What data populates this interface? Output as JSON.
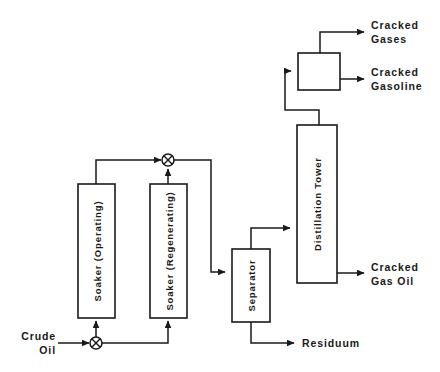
{
  "diagram": {
    "type": "process-flow-diagram",
    "colors": {
      "line": "#1a1a1a",
      "background": "#ffffff",
      "box_fill": "#ffffff"
    },
    "units": [
      {
        "id": "soaker-operating",
        "label": "Soaker (Operating)",
        "orientation": "vertical-text",
        "x": 78,
        "y": 184,
        "w": 37,
        "h": 134
      },
      {
        "id": "soaker-regenerating",
        "label": "Soaker (Regenerating)",
        "orientation": "vertical-text",
        "x": 150,
        "y": 184,
        "w": 37,
        "h": 134
      },
      {
        "id": "separator",
        "label": "Separator",
        "orientation": "vertical-text",
        "x": 232,
        "y": 249,
        "w": 38,
        "h": 73
      },
      {
        "id": "distillation-tower",
        "label": "Distillation Tower",
        "orientation": "vertical-text",
        "x": 297,
        "y": 125,
        "w": 40,
        "h": 158
      },
      {
        "id": "overhead-drum",
        "label": "",
        "orientation": "none",
        "x": 298,
        "y": 53,
        "w": 42,
        "h": 37
      }
    ],
    "valves": [
      {
        "id": "feed-valve",
        "symbol": "crossed-circle",
        "cx": 96,
        "cy": 343,
        "r": 6
      },
      {
        "id": "product-valve",
        "symbol": "crossed-circle",
        "cx": 168,
        "cy": 160,
        "r": 6
      }
    ],
    "streams": [
      {
        "id": "crude-oil-inlet",
        "label": "Crude\nOil",
        "side": "left",
        "x": 14,
        "y": 330
      },
      {
        "id": "cracked-gases-outlet",
        "label": "Cracked\nGases",
        "side": "right",
        "x": 371,
        "y": 19
      },
      {
        "id": "cracked-gasoline-outlet",
        "label": "Cracked\nGasoline",
        "side": "right",
        "x": 371,
        "y": 66
      },
      {
        "id": "cracked-gas-oil-outlet",
        "label": "Cracked\nGas Oil",
        "side": "right",
        "x": 371,
        "y": 261
      },
      {
        "id": "residuum-outlet",
        "label": "Residuum",
        "side": "right",
        "x": 302,
        "y": 337
      }
    ]
  }
}
